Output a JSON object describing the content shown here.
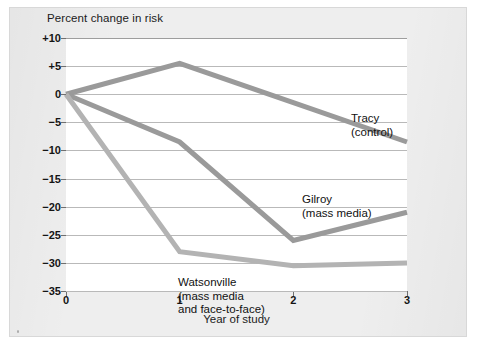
{
  "chart_data": {
    "type": "line",
    "title": "",
    "subtitle": "",
    "xlabel": "Year of study",
    "ylabel": "Percent change in risk",
    "x": [
      0,
      1,
      2,
      3
    ],
    "xtick_labels": [
      "0",
      "1",
      "2",
      "3"
    ],
    "xlim": [
      0,
      3
    ],
    "ylim": [
      -35,
      10
    ],
    "ytick_values": [
      10,
      5,
      0,
      -5,
      -10,
      -15,
      -20,
      -25,
      -30,
      -35
    ],
    "ytick_labels": [
      "+10",
      "+5",
      "0",
      "−5",
      "−10",
      "−15",
      "−20",
      "−25",
      "−30",
      "−35"
    ],
    "grid": "horizontal",
    "legend_position": "inline-annotations",
    "series": [
      {
        "name": "Tracy (control)",
        "label_line1": "Tracy",
        "label_line2": "(control)",
        "values": [
          0,
          5.5,
          -1.5,
          -8.5
        ],
        "color": "#9a9a9a"
      },
      {
        "name": "Gilroy (mass media)",
        "label_line1": "Gilroy",
        "label_line2": "(mass media)",
        "values": [
          0,
          -8.5,
          -26,
          -21
        ],
        "color": "#9a9a9a"
      },
      {
        "name": "Watsonville (mass media and face-to-face)",
        "label_line1": "Watsonville",
        "label_line2": "(mass media",
        "label_line3": "and face-to-face)",
        "values": [
          0,
          -28,
          -30.5,
          -30
        ],
        "color": "#b3b3b3"
      }
    ],
    "colors": {
      "page_background": "#eeeeee",
      "plot_background": "#ffffff",
      "gridline": "#b9b9b9",
      "axis": "#6f6f6f",
      "series_dark": "#9a9a9a",
      "series_light": "#b3b3b3",
      "text": "#141414"
    }
  }
}
